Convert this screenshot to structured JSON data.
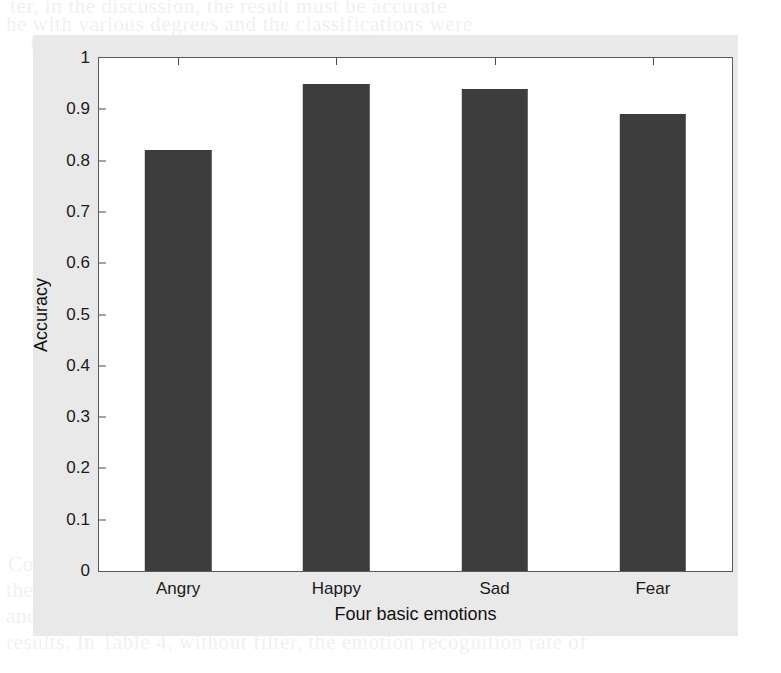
{
  "figure": {
    "background_color": "#e9e9e9",
    "plot_background_color": "#ffffff",
    "axis_color": "#5a5a5a"
  },
  "chart_data": {
    "type": "bar",
    "title": "",
    "subtitle": "",
    "categories": [
      "Angry",
      "Happy",
      "Sad",
      "Fear"
    ],
    "values": [
      0.82,
      0.95,
      0.94,
      0.89
    ],
    "series": [
      {
        "name": "Accuracy",
        "values": [
          0.82,
          0.95,
          0.94,
          0.89
        ],
        "color": "#3d3d3d"
      }
    ],
    "xlabel": "Four basic emotions",
    "ylabel": "Accuracy",
    "ylim": [
      0,
      1
    ],
    "yticks": [
      0,
      0.1,
      0.2,
      0.3,
      0.4,
      0.5,
      0.6,
      0.7,
      0.8,
      0.9,
      1
    ],
    "ytick_labels": [
      "0",
      "0.1",
      "0.2",
      "0.3",
      "0.4",
      "0.5",
      "0.6",
      "0.7",
      "0.8",
      "0.9",
      "1"
    ],
    "grid": false,
    "legend": null,
    "legend_position": "none",
    "bar_color": "#3d3d3d",
    "bar_width_fraction": 0.42
  },
  "page_bleed": {
    "lines": [
      "ter, in the discussion, the result must be accurate",
      "he with various degrees and the classifications were",
      "model, the emotion release based on four basic",
      "the five most reliable emotional states",
      "Table 4. Recognition accuracy comparison",
      "Comparison Study Accuracy",
      "Mel-scale features 82",
      "MFCC 85",
      "LPCC 88",
      "Acoustic features Prosodic 91",
      "Energy 87",
      "Pitch 84",
      "Spectral MFCC 92",
      "Formant 86",
      "Comparison with the results of the earlier studies for",
      "the emotion recognition accuracy on the same corpus",
      "and the proposed method presented significantly",
      "results. In Table 4, without filter, the emotion recognition rate of"
    ],
    "positions": [
      {
        "x": 10,
        "y": -6
      },
      {
        "x": 6,
        "y": 12
      },
      {
        "x": 30,
        "y": 30
      },
      {
        "x": 70,
        "y": 52
      },
      {
        "x": 190,
        "y": 140
      },
      {
        "x": 210,
        "y": 168
      },
      {
        "x": 220,
        "y": 196
      },
      {
        "x": 230,
        "y": 224
      },
      {
        "x": 230,
        "y": 252
      },
      {
        "x": 205,
        "y": 282
      },
      {
        "x": 245,
        "y": 310
      },
      {
        "x": 245,
        "y": 338
      },
      {
        "x": 225,
        "y": 366
      },
      {
        "x": 250,
        "y": 394
      },
      {
        "x": 8,
        "y": 552
      },
      {
        "x": 6,
        "y": 578
      },
      {
        "x": 6,
        "y": 604
      },
      {
        "x": 6,
        "y": 630
      }
    ]
  }
}
